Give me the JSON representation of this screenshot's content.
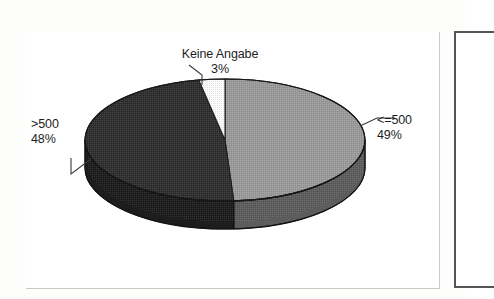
{
  "document": {
    "kind": "scanned-figure",
    "background_color": "#fdfdfc"
  },
  "chart_frame": {
    "name": "chart-border",
    "border_color": "#4a4a4a"
  },
  "adjacent_frame": {
    "name": "adjacent-figure-border",
    "border_color": "#555555"
  },
  "chart_data": {
    "type": "pie",
    "title": "",
    "subtitle": "",
    "xlabel": "",
    "ylabel": "",
    "legend_position": "none",
    "grid": false,
    "three_d": true,
    "labels_outside": true,
    "categories": [
      "<=500",
      ">500",
      "Keine Angabe"
    ],
    "values": [
      49,
      48,
      3
    ],
    "unit": "%",
    "slices": [
      {
        "label": "<=500",
        "percent_text": "49%",
        "value": 49,
        "color": "#9b9b9b",
        "side_color": "#5d5d5d",
        "label_position": "right"
      },
      {
        "label": ">500",
        "percent_text": "48%",
        "value": 48,
        "color": "#2f2f2f",
        "side_color": "#1d1d1d",
        "label_position": "left"
      },
      {
        "label": "Keine Angabe",
        "percent_text": "3%",
        "value": 3,
        "color": "#fbfbfb",
        "side_color": "#d8d8d8",
        "label_position": "top"
      }
    ],
    "outline_color": "#1a1a1a"
  },
  "labels": {
    "keine_angabe": {
      "name": "Keine Angabe",
      "percent": "3%"
    },
    "lte_500": {
      "name": "<=500",
      "percent": "49%"
    },
    "gt_500": {
      "name": ">500",
      "percent": "48%"
    }
  },
  "leader_lines": {
    "keine_angabe": "from label down-right to top of white slice",
    "lte_500": "from label left to right edge of light-grey slice",
    "gt_500": "from label down-right to left edge of dark slice"
  }
}
